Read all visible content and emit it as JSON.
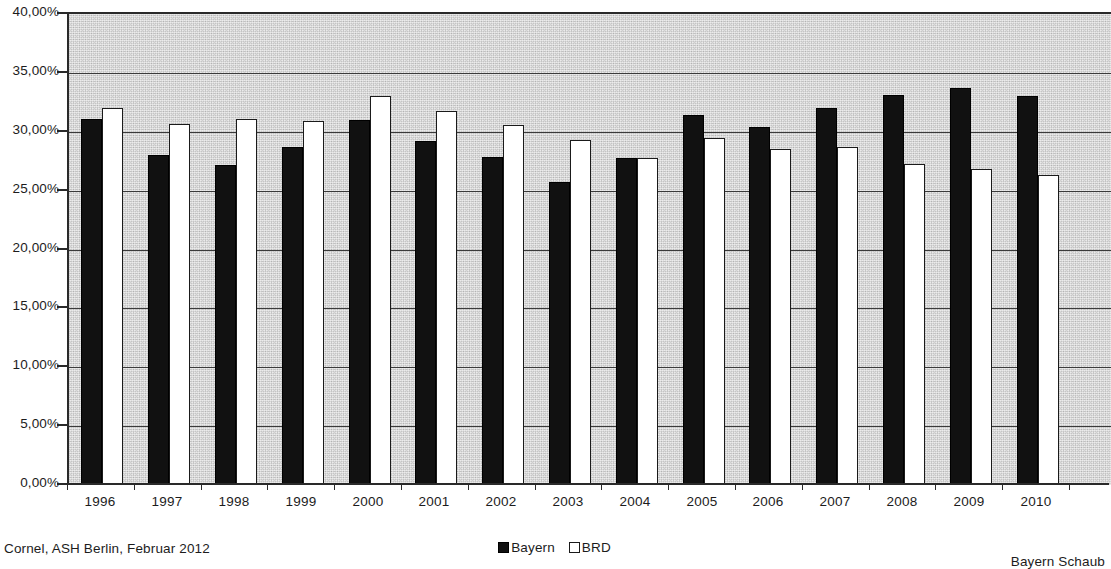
{
  "chart_data": {
    "type": "bar",
    "title": "",
    "subtitle": "",
    "xlabel": "",
    "ylabel": "",
    "categories": [
      "1996",
      "1997",
      "1998",
      "1999",
      "2000",
      "2001",
      "2002",
      "2003",
      "2004",
      "2005",
      "2006",
      "2007",
      "2008",
      "2009",
      "2010"
    ],
    "series": [
      {
        "name": "Bayern",
        "color": "#111111",
        "values": [
          31.1,
          28.0,
          27.2,
          28.7,
          31.0,
          29.2,
          27.9,
          25.7,
          27.8,
          31.4,
          30.4,
          32.0,
          33.1,
          33.7,
          33.0
        ]
      },
      {
        "name": "BRD",
        "color": "#ffffff",
        "values": [
          32.0,
          30.7,
          31.1,
          30.9,
          33.0,
          31.8,
          30.6,
          29.3,
          27.8,
          29.5,
          28.5,
          28.7,
          27.3,
          26.8,
          26.3
        ]
      }
    ],
    "ylim": [
      0,
      40
    ],
    "ytick_values": [
      0,
      5,
      10,
      15,
      20,
      25,
      30,
      35,
      40
    ],
    "ytick_labels": [
      "0,00%",
      "5,00%",
      "10,00%",
      "15,00%",
      "20,00%",
      "25,00%",
      "30,00%",
      "35,00%",
      "40,00%"
    ],
    "grid": true,
    "grid_axis": "y",
    "legend_position": "bottom-center",
    "unit": "percent",
    "decimal_separator": ","
  },
  "legend": {
    "entries": [
      {
        "label": "Bayern",
        "swatch": "filled-black-square"
      },
      {
        "label": "BRD",
        "swatch": "outlined-white-square"
      }
    ]
  },
  "footer": {
    "source": "Cornel, ASH Berlin, Februar 2012",
    "right_note": "Bayern Schaub"
  }
}
